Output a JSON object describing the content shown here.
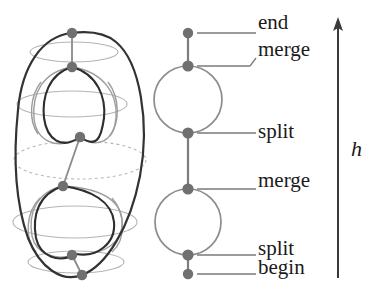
{
  "figure": {
    "colors": {
      "surface_outline": "#333333",
      "hidden_contour": "#a9a9a9",
      "visible_contour": "#9a9a9a",
      "node": "#707070",
      "graph_edge": "#808080",
      "leader_line": "#7a7a7a",
      "axis": "#3a3a3a",
      "text": "#1a1a1a",
      "background": "#ffffff"
    }
  },
  "surface": {
    "name": "genus-2-surface",
    "critical_nodes": [
      {
        "id": "end",
        "x": 72,
        "y": 33
      },
      {
        "id": "merge1",
        "x": 72,
        "y": 67
      },
      {
        "id": "split1",
        "x": 80,
        "y": 137
      },
      {
        "id": "merge2",
        "x": 63,
        "y": 186
      },
      {
        "id": "split2",
        "x": 72,
        "y": 255
      },
      {
        "id": "begin",
        "x": 82,
        "y": 275
      }
    ]
  },
  "reeb_graph": {
    "name": "reeb-graph",
    "axis_x": 188,
    "nodes": [
      {
        "id": "end",
        "x": 188,
        "y": 33,
        "label": "end"
      },
      {
        "id": "merge1",
        "x": 188,
        "y": 66,
        "label": "merge"
      },
      {
        "id": "split1",
        "x": 188,
        "y": 133,
        "label": "split"
      },
      {
        "id": "merge2",
        "x": 188,
        "y": 189,
        "label": "merge"
      },
      {
        "id": "split2",
        "x": 188,
        "y": 255,
        "label": "split"
      },
      {
        "id": "begin",
        "x": 188,
        "y": 274,
        "label": "begin"
      }
    ],
    "loops": [
      {
        "id": "upper-loop",
        "cx": 188,
        "cy": 99.5,
        "rx": 34,
        "ry": 33.5
      },
      {
        "id": "lower-loop",
        "cx": 188,
        "cy": 222,
        "rx": 33,
        "ry": 33
      }
    ]
  },
  "labels": [
    {
      "id": "label-end",
      "text": "end",
      "x": 258,
      "y": 14,
      "leader_y": 33,
      "leader_x1": 197,
      "leader_x2": 256
    },
    {
      "id": "label-merge1",
      "text": "merge",
      "x": 258,
      "y": 39,
      "leader_y": 66,
      "leader_x1": 197,
      "leader_x2": 256
    },
    {
      "id": "label-split1",
      "text": "split",
      "x": 258,
      "y": 121,
      "leader_y": 133,
      "leader_x1": 197,
      "leader_x2": 256
    },
    {
      "id": "label-merge2",
      "text": "merge",
      "x": 258,
      "y": 170,
      "leader_y": 189,
      "leader_x1": 197,
      "leader_x2": 256
    },
    {
      "id": "label-split2",
      "text": "split",
      "x": 258,
      "y": 238,
      "leader_y": 255,
      "leader_x1": 197,
      "leader_x2": 256
    },
    {
      "id": "label-begin",
      "text": "begin",
      "x": 258,
      "y": 258,
      "leader_y": 274,
      "leader_x1": 197,
      "leader_x2": 256
    }
  ],
  "height_axis": {
    "name": "height-function-axis",
    "symbol": "h",
    "x": 338,
    "y_bottom": 278,
    "y_top": 20,
    "symbol_x": 352,
    "symbol_y": 140
  }
}
